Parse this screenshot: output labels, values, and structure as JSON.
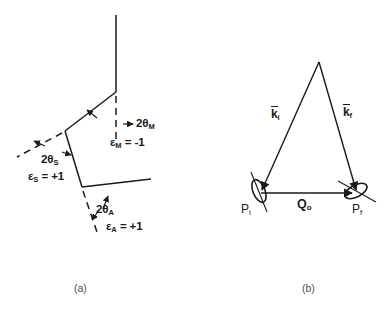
{
  "figure": {
    "title_visible": false,
    "background_color": "#ffffff",
    "stroke_color": "#1a1a1a",
    "text_color": "#1a1a1a",
    "caption_color": "#4d4d4d"
  },
  "panel_a": {
    "caption": "(a)",
    "labels": {
      "monochromator_angle": "2θ",
      "monochromator_angle_sub": "M",
      "monochromator_eps": "ε",
      "monochromator_eps_sub": "M",
      "monochromator_eps_value": " = -1",
      "sample_angle": "2θ",
      "sample_angle_sub": "S",
      "sample_eps": "ε",
      "sample_eps_sub": "S",
      "sample_eps_value": " = +1",
      "analyzer_angle": "2θ",
      "analyzer_angle_sub": "A",
      "analyzer_eps": "ε",
      "analyzer_eps_sub": "A",
      "analyzer_eps_value": " = +1"
    },
    "geometry": {
      "incident_arm_top": [
        116,
        15
      ],
      "monochromator_vertex": [
        116,
        92
      ],
      "sample_vertex": [
        65,
        131
      ],
      "analyzer_vertex": [
        82,
        187
      ],
      "analyzer_arm_end": [
        151,
        179
      ],
      "mono_dashed_end": [
        116,
        141
      ],
      "sample_dashed_end": [
        18,
        156
      ],
      "analyzer_dashed_end": [
        96,
        231
      ]
    }
  },
  "panel_b": {
    "caption": "(b)",
    "labels": {
      "k_initial": "k",
      "k_initial_sub": "i",
      "k_final": "k",
      "k_final_sub": "f",
      "q_vector": "Q",
      "q_vector_sub": "o",
      "point_initial": "P",
      "point_initial_sub": "i",
      "point_final": "P",
      "point_final_sub": "f"
    },
    "geometry": {
      "apex": [
        319,
        62
      ],
      "p_initial": [
        259,
        193
      ],
      "p_final": [
        355,
        193
      ],
      "q_arrow_start": [
        262,
        193
      ],
      "q_arrow_end": [
        354,
        193
      ]
    }
  }
}
